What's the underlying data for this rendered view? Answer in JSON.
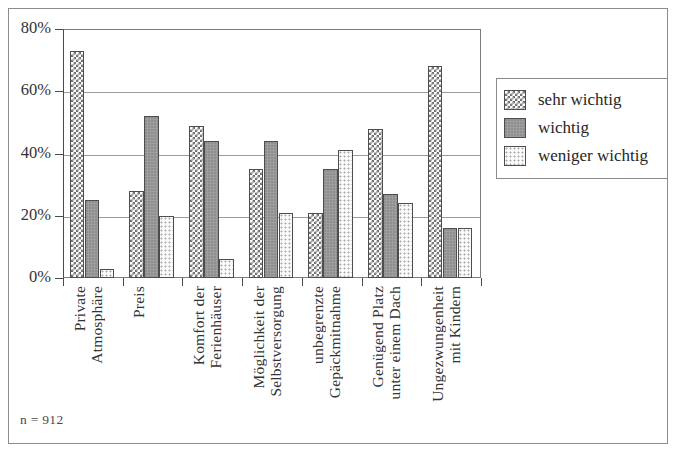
{
  "chart_data": {
    "type": "bar",
    "title": "",
    "subtitle": "",
    "xlabel": "",
    "ylabel": "",
    "ylim": [
      0,
      80
    ],
    "y_tick_labels": [
      "0%",
      "20%",
      "40%",
      "60%",
      "80%"
    ],
    "y_tick_values": [
      0,
      20,
      40,
      60,
      80
    ],
    "grid": true,
    "legend_position": "right",
    "annotation": "n = 912",
    "categories": [
      "Private\nAtmosphäre",
      "Preis",
      "Komfort der\nFerienhäuser",
      "Möglichkeit der\nSelbstversorgung",
      "unbegrenzte\nGepäckmitnahme",
      "Genügend Platz\nunter einem Dach",
      "Ungezwungenheit\nmit Kindern"
    ],
    "series": [
      {
        "name": "sehr wichtig",
        "pattern": "checkerboard",
        "color": "#6e6e6e",
        "values": [
          73,
          28,
          49,
          35,
          21,
          48,
          68
        ]
      },
      {
        "name": "wichtig",
        "pattern": "solid-gray",
        "color": "#9e9e9e",
        "values": [
          25,
          52,
          44,
          44,
          35,
          27,
          16
        ]
      },
      {
        "name": "weniger wichtig",
        "pattern": "light-dots",
        "color": "#fbfbfb",
        "values": [
          3,
          20,
          6,
          21,
          41,
          24,
          16
        ]
      }
    ]
  },
  "legend": {
    "items": [
      {
        "label": "sehr wichtig"
      },
      {
        "label": "wichtig"
      },
      {
        "label": "weniger wichtig"
      }
    ]
  },
  "footnote": {
    "text": "n = 912"
  }
}
